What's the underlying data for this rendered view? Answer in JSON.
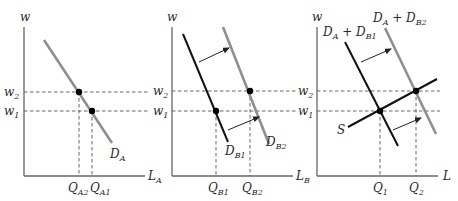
{
  "figure": {
    "colors": {
      "axis": "#666666",
      "black_curve": "#111111",
      "gray_curve": "#8f8f8f",
      "dashed": "#555555",
      "text": "#2a2a2a"
    },
    "panels": [
      {
        "id": "sector-a",
        "y_axis_label": "w",
        "x_axis_label": {
          "main": "L",
          "sub": "A"
        },
        "wage_labels": [
          {
            "main": "w",
            "sub": "2"
          },
          {
            "main": "w",
            "sub": "1"
          }
        ],
        "quantity_labels": [
          {
            "main": "Q",
            "sub": "A2"
          },
          {
            "main": "Q",
            "sub": "A1"
          }
        ],
        "curves": [
          {
            "main": "D",
            "sub": "A"
          }
        ]
      },
      {
        "id": "sector-b",
        "y_axis_label": "w",
        "x_axis_label": {
          "main": "L",
          "sub": "B"
        },
        "wage_labels": [
          {
            "main": "w",
            "sub": "2"
          },
          {
            "main": "w",
            "sub": "1"
          }
        ],
        "quantity_labels": [
          {
            "main": "Q",
            "sub": "B1"
          },
          {
            "main": "Q",
            "sub": "B2"
          }
        ],
        "curves": [
          {
            "main": "D",
            "sub": "B1"
          },
          {
            "main": "D",
            "sub": "B2"
          }
        ]
      },
      {
        "id": "total-market",
        "y_axis_label": "w",
        "x_axis_label": {
          "main": "L",
          "sub": ""
        },
        "wage_labels": [
          {
            "main": "w",
            "sub": "2"
          },
          {
            "main": "w",
            "sub": "1"
          }
        ],
        "quantity_labels": [
          {
            "main": "Q",
            "sub": "1"
          },
          {
            "main": "Q",
            "sub": "2"
          }
        ],
        "curves": [
          {
            "main": "D",
            "sub": "A",
            "plus": " + D",
            "sub2": "B1"
          },
          {
            "main": "D",
            "sub": "A",
            "plus": " + D",
            "sub2": "B2"
          },
          {
            "main": "S",
            "sub": ""
          }
        ]
      }
    ]
  }
}
